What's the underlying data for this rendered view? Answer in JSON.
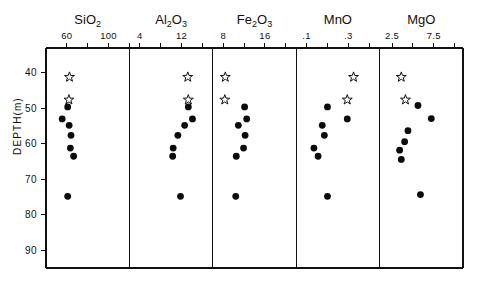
{
  "chart_data": {
    "type": "scatter",
    "title": "",
    "ylabel": "DEPTH(m)",
    "ylim": [
      33,
      95
    ],
    "y_ticks": [
      40,
      50,
      60,
      70,
      80,
      90
    ],
    "y_tick_labels": [
      "40",
      "50",
      "60",
      "70",
      "80",
      "90"
    ],
    "grid": false,
    "legend": false,
    "marker_kinds": [
      {
        "name": "filled-circle",
        "symbol": "dot",
        "meaning": "sample"
      },
      {
        "name": "open-star",
        "symbol": "star",
        "meaning": "sample"
      }
    ],
    "panels": [
      {
        "title": "SiO2",
        "title_base": "SiO",
        "title_sub": "2",
        "xlabel": "SiO2",
        "xlim": [
          40,
          120
        ],
        "x_ticks": [
          60,
          80,
          100,
          120
        ],
        "x_tick_labels": [
          "60",
          "",
          "100",
          ""
        ],
        "labeled_ticks": [
          {
            "value": 60,
            "label": "60"
          },
          {
            "value": 100,
            "label": "100"
          }
        ],
        "series": [
          {
            "name": "stars",
            "marker": "open-star",
            "points": [
              {
                "x": 62.5,
                "y": 41.2
              },
              {
                "x": 62.0,
                "y": 47.6
              }
            ]
          },
          {
            "name": "circles",
            "marker": "filled-circle",
            "points": [
              {
                "x": 60.8,
                "y": 49.6
              },
              {
                "x": 55.5,
                "y": 53.0
              },
              {
                "x": 62.2,
                "y": 54.8
              },
              {
                "x": 64.0,
                "y": 57.6
              },
              {
                "x": 63.4,
                "y": 61.2
              },
              {
                "x": 66.5,
                "y": 63.5
              },
              {
                "x": 60.8,
                "y": 74.8
              }
            ]
          }
        ]
      },
      {
        "title": "Al2O3",
        "title_base": "Al",
        "title_sub": "2",
        "title_base2": "O",
        "title_sub2": "3",
        "xlabel": "Al2O3",
        "xlim": [
          2,
          18
        ],
        "x_ticks": [
          4,
          8,
          12,
          16
        ],
        "x_tick_labels": [
          "4",
          "",
          "12",
          ""
        ],
        "labeled_ticks": [
          {
            "value": 4,
            "label": "4"
          },
          {
            "value": 12,
            "label": "12"
          }
        ],
        "series": [
          {
            "name": "stars",
            "marker": "open-star",
            "points": [
              {
                "x": 13.2,
                "y": 41.2
              },
              {
                "x": 13.3,
                "y": 47.6
              }
            ]
          },
          {
            "name": "circles",
            "marker": "filled-circle",
            "points": [
              {
                "x": 13.3,
                "y": 49.6
              },
              {
                "x": 14.1,
                "y": 53.0
              },
              {
                "x": 12.6,
                "y": 54.8
              },
              {
                "x": 11.3,
                "y": 57.6
              },
              {
                "x": 10.4,
                "y": 61.2
              },
              {
                "x": 10.3,
                "y": 63.5
              },
              {
                "x": 11.8,
                "y": 74.8
              }
            ]
          }
        ]
      },
      {
        "title": "Fe2O3",
        "title_base": "Fe",
        "title_sub": "2",
        "title_base2": "O",
        "title_sub2": "3",
        "xlabel": "Fe2O3",
        "xlim": [
          6,
          22
        ],
        "x_ticks": [
          8,
          12,
          16,
          20
        ],
        "x_tick_labels": [
          "8",
          "",
          "16",
          ""
        ],
        "labeled_ticks": [
          {
            "value": 8,
            "label": "8"
          },
          {
            "value": 16,
            "label": "16"
          }
        ],
        "series": [
          {
            "name": "stars",
            "marker": "open-star",
            "points": [
              {
                "x": 8.4,
                "y": 41.2
              },
              {
                "x": 8.3,
                "y": 47.6
              }
            ]
          },
          {
            "name": "circles",
            "marker": "filled-circle",
            "points": [
              {
                "x": 12.1,
                "y": 49.6
              },
              {
                "x": 12.5,
                "y": 53.0
              },
              {
                "x": 10.9,
                "y": 54.8
              },
              {
                "x": 12.2,
                "y": 57.6
              },
              {
                "x": 11.9,
                "y": 61.2
              },
              {
                "x": 10.5,
                "y": 63.5
              },
              {
                "x": 10.4,
                "y": 74.8
              }
            ]
          }
        ]
      },
      {
        "title": "MnO",
        "title_base": "Mn",
        "title_sub": "",
        "title_base2": "O",
        "title_sub2": "",
        "xlabel": "MnO",
        "xlim": [
          0.05,
          0.45
        ],
        "x_ticks": [
          0.1,
          0.2,
          0.3,
          0.4
        ],
        "x_tick_labels": [
          ".1",
          "",
          ".3",
          ""
        ],
        "labeled_ticks": [
          {
            "value": 0.1,
            "label": ".1"
          },
          {
            "value": 0.3,
            "label": ".3"
          }
        ],
        "series": [
          {
            "name": "stars",
            "marker": "open-star",
            "points": [
              {
                "x": 0.325,
                "y": 41.2
              },
              {
                "x": 0.295,
                "y": 47.6
              }
            ]
          },
          {
            "name": "circles",
            "marker": "filled-circle",
            "points": [
              {
                "x": 0.2,
                "y": 49.6
              },
              {
                "x": 0.295,
                "y": 53.0
              },
              {
                "x": 0.175,
                "y": 54.8
              },
              {
                "x": 0.185,
                "y": 57.6
              },
              {
                "x": 0.135,
                "y": 61.2
              },
              {
                "x": 0.155,
                "y": 63.5
              },
              {
                "x": 0.2,
                "y": 74.8
              }
            ]
          }
        ]
      },
      {
        "title": "MgO",
        "title_base": "Mg",
        "title_sub": "",
        "title_base2": "O",
        "title_sub2": "",
        "xlabel": "MgO",
        "xlim": [
          1,
          11
        ],
        "x_ticks": [
          2.5,
          5.0,
          7.5,
          10.0
        ],
        "x_tick_labels": [
          "2.5",
          "",
          "7.5",
          ""
        ],
        "labeled_ticks": [
          {
            "value": 2.5,
            "label": "2.5"
          },
          {
            "value": 7.5,
            "label": "7.5"
          }
        ],
        "series": [
          {
            "name": "stars",
            "marker": "open-star",
            "points": [
              {
                "x": 3.6,
                "y": 41.2
              },
              {
                "x": 4.1,
                "y": 47.6
              }
            ]
          },
          {
            "name": "circles",
            "marker": "filled-circle",
            "points": [
              {
                "x": 5.6,
                "y": 49.2
              },
              {
                "x": 7.2,
                "y": 52.9
              },
              {
                "x": 4.4,
                "y": 56.3
              },
              {
                "x": 4.0,
                "y": 59.4
              },
              {
                "x": 3.4,
                "y": 61.8
              },
              {
                "x": 3.6,
                "y": 64.4
              },
              {
                "x": 5.9,
                "y": 74.3
              }
            ]
          }
        ]
      }
    ]
  }
}
